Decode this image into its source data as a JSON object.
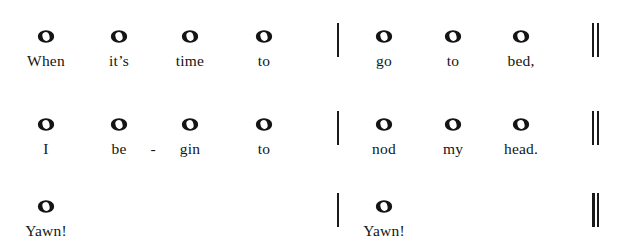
{
  "colors": {
    "ink": "#141414",
    "background": "#ffffff"
  },
  "notation": {
    "note_symbol": "whole-note",
    "barline_label": "barline",
    "final_barline_label": "double-barline"
  },
  "systems": [
    {
      "id": "system-1",
      "measures": [
        {
          "notes": [
            {
              "x": 46,
              "lyric": "When"
            },
            {
              "x": 119,
              "lyric": "it’s"
            },
            {
              "x": 190,
              "lyric": "time"
            },
            {
              "x": 264,
              "lyric": "to"
            }
          ]
        },
        {
          "notes": [
            {
              "x": 384,
              "lyric": "go"
            },
            {
              "x": 453,
              "lyric": "to"
            },
            {
              "x": 521,
              "lyric": "bed,"
            }
          ]
        }
      ],
      "barline_x": 337,
      "final_barline_x": 592,
      "hyphens": []
    },
    {
      "id": "system-2",
      "measures": [
        {
          "notes": [
            {
              "x": 46,
              "lyric": "I"
            },
            {
              "x": 119,
              "lyric": "be"
            },
            {
              "x": 190,
              "lyric": "gin"
            },
            {
              "x": 264,
              "lyric": "to"
            }
          ]
        },
        {
          "notes": [
            {
              "x": 384,
              "lyric": "nod"
            },
            {
              "x": 453,
              "lyric": "my"
            },
            {
              "x": 521,
              "lyric": "head."
            }
          ]
        }
      ],
      "barline_x": 337,
      "final_barline_x": 592,
      "hyphens": [
        {
          "x": 153,
          "text": "-"
        }
      ]
    },
    {
      "id": "system-3",
      "measures": [
        {
          "notes": [
            {
              "x": 46,
              "lyric": "Yawn!"
            }
          ]
        },
        {
          "notes": [
            {
              "x": 384,
              "lyric": "Yawn!"
            }
          ]
        }
      ],
      "barline_x": 337,
      "final_barline_x": 592,
      "final_barline_heavy": true,
      "hyphens": []
    }
  ]
}
